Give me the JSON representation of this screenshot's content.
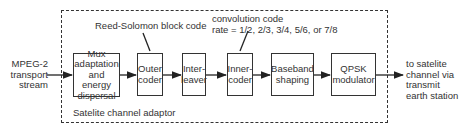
{
  "input_label": [
    "MPEG-2",
    "transport",
    "stream"
  ],
  "output_label": [
    "to satelite",
    "channel via",
    "transmit",
    "earth station"
  ],
  "frame_label": "Satelite channel adaptor",
  "annotations": {
    "outer_code": "Reed-Solomon block code",
    "inner_code_line1": "convolution code",
    "inner_code_line2": "rate = 1/2, 2/3, 3/4, 5/6, or 7/8"
  },
  "blocks": [
    {
      "id": "mux",
      "lines": [
        "Mux",
        "adaptation",
        "and",
        "energy",
        "dispersal"
      ]
    },
    {
      "id": "outer",
      "lines": [
        "Outer",
        "coder"
      ]
    },
    {
      "id": "interleaver",
      "lines": [
        "Inter-",
        "leaver"
      ]
    },
    {
      "id": "inner",
      "lines": [
        "Inner-",
        "coder"
      ]
    },
    {
      "id": "baseband",
      "lines": [
        "Baseband",
        "shaping"
      ]
    },
    {
      "id": "qpsk",
      "lines": [
        "QPSK",
        "modulator"
      ]
    }
  ]
}
